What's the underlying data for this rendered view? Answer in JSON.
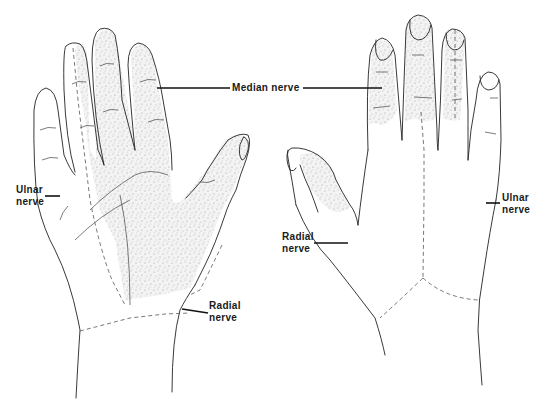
{
  "figure": {
    "views": [
      {
        "id": "palmar",
        "side": "left"
      },
      {
        "id": "dorsal",
        "side": "right"
      }
    ]
  },
  "labels": {
    "median": "Median nerve",
    "ulnar_palmar_line1": "Ulnar",
    "ulnar_palmar_line2": "nerve",
    "radial_palmar_line1": "Radial",
    "radial_palmar_line2": "nerve",
    "radial_dorsal_line1": "Radial",
    "radial_dorsal_line2": "nerve",
    "ulnar_dorsal_line1": "Ulnar",
    "ulnar_dorsal_line2": "nerve"
  },
  "colors": {
    "line": "#222222",
    "stipple": "#9a9a9a",
    "background": "#ffffff"
  }
}
